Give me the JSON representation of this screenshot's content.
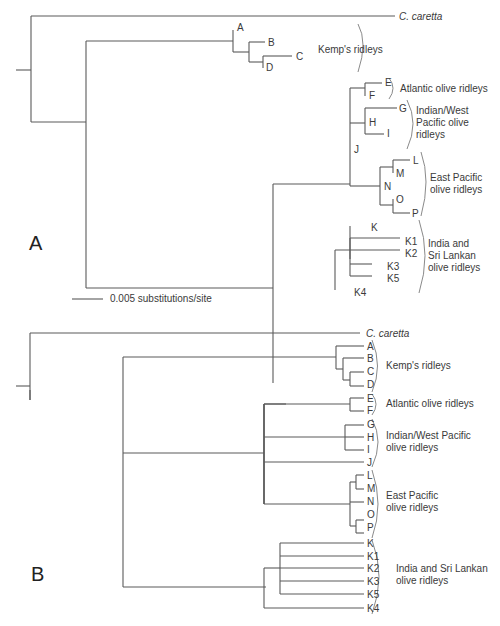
{
  "panels": {
    "a": {
      "label": "A"
    },
    "b": {
      "label": "B"
    }
  },
  "scale_bar": {
    "label": "0.005 substitutions/site"
  },
  "outgroup": "C. caretta",
  "tree_a": {
    "tips": {
      "A": "A",
      "B": "B",
      "C": "C",
      "D": "D",
      "E": "E",
      "F": "F",
      "G": "G",
      "H": "H",
      "I": "I",
      "J": "J",
      "L": "L",
      "M": "M",
      "N": "N",
      "O": "O",
      "P": "P",
      "K": "K",
      "K1": "K1",
      "K2": "K2",
      "K3": "K3",
      "K5": "K5",
      "K4": "K4"
    },
    "groups": {
      "kemps": "Kemp's ridleys",
      "atlantic": "Atlantic olive ridleys",
      "indian_line1": "Indian/West",
      "indian_line2": "Pacific olive",
      "indian_line3": "ridleys",
      "east_line1": "East Pacific",
      "east_line2": "olive ridleys",
      "india_line1": "India and",
      "india_line2": "Sri Lankan",
      "india_line3": "olive ridleys"
    }
  },
  "tree_b": {
    "tips": [
      "A",
      "B",
      "C",
      "D",
      "E",
      "F",
      "G",
      "H",
      "I",
      "J",
      "L",
      "M",
      "N",
      "O",
      "P",
      "K",
      "K1",
      "K2",
      "K3",
      "K5",
      "K4"
    ],
    "groups": {
      "kemps": "Kemp's ridleys",
      "atlantic": "Atlantic olive ridleys",
      "indian_line1": "Indian/West Pacific",
      "indian_line2": "olive ridleys",
      "east_line1": "East Pacific",
      "east_line2": "olive ridleys",
      "india_line1": "India and Sri Lankan",
      "india_line2": "olive ridleys"
    }
  }
}
